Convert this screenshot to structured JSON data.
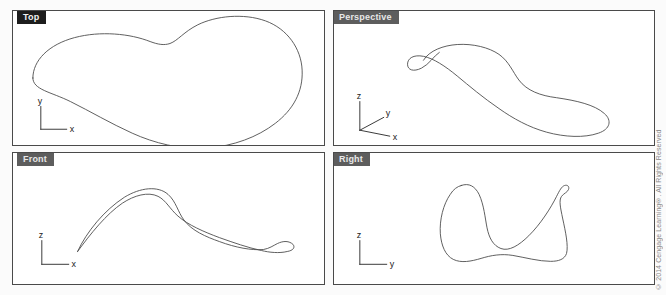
{
  "app": {
    "title": "Four-Viewport CAD Layout",
    "background_color": "#fbfbfb",
    "canvas_color": "#ffffff",
    "curve_color": "#4c4c4c",
    "frame_color": "#4a4a4a"
  },
  "viewports": [
    {
      "id": "top",
      "label": "Top",
      "tab_style": "black",
      "tab_color": "#1d1d1d",
      "axes": [
        {
          "name": "y",
          "direction": "up"
        },
        {
          "name": "x",
          "direction": "right"
        }
      ],
      "curve_description": "Closed freeform kidney/heart-shaped planar outline of the 3D curve projected to the XY plane"
    },
    {
      "id": "perspective",
      "label": "Perspective",
      "tab_style": "grey",
      "tab_color": "#5d5d5d",
      "axes": [
        {
          "name": "z",
          "direction": "up"
        },
        {
          "name": "y",
          "direction": "diagonal-up-right"
        },
        {
          "name": "x",
          "direction": "right-down"
        }
      ],
      "curve_description": "Closed freeform 3D space curve shown in pictorial perspective with a small self-crossing loop at upper left"
    },
    {
      "id": "front",
      "label": "Front",
      "tab_style": "grey",
      "tab_color": "#5d5d5d",
      "axes": [
        {
          "name": "z",
          "direction": "up"
        },
        {
          "name": "x",
          "direction": "right"
        }
      ],
      "curve_description": "Closed freeform S-shaped sliver outline of the 3D curve projected to the XZ plane"
    },
    {
      "id": "right",
      "label": "Right",
      "tab_style": "grey",
      "tab_color": "#5d5d5d",
      "axes": [
        {
          "name": "z",
          "direction": "up"
        },
        {
          "name": "y",
          "direction": "right"
        }
      ],
      "curve_description": "Closed freeform wedge-shaped outline of the 3D curve projected to the YZ plane, with a small cusp at upper right"
    }
  ],
  "copyright": "© 2014 Cengage Learning®. All Rights Reserved"
}
